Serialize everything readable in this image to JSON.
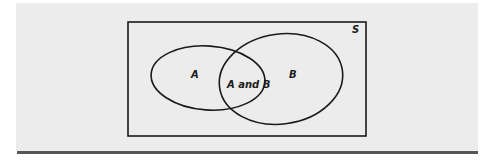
{
  "diagram": {
    "type": "venn",
    "universe_label": "S",
    "sets": [
      {
        "name": "A",
        "label": "A"
      },
      {
        "name": "B",
        "label": "B"
      }
    ],
    "intersection_label": "A and B"
  },
  "colors": {
    "panel_bg": "#ececec",
    "stroke": "#1a1a1a",
    "rule": "#555555"
  }
}
